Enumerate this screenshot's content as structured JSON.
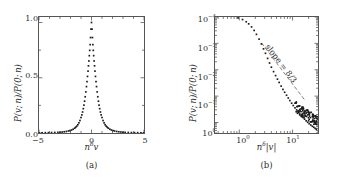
{
  "figure": {
    "panel_a_label": "(a)",
    "panel_b_label": "(b)"
  },
  "panel_a": {
    "ylabel": "P(v; n)/P(0; n)",
    "xlabel_base": "n",
    "xlabel_exp": "δ",
    "xlabel_tail": "v",
    "yticks": [
      "0.0",
      "0.5",
      "1.0"
    ],
    "xticks": [
      "−5",
      "0",
      "5"
    ]
  },
  "panel_b": {
    "ylabel": "P(v; n)/P(0; n)",
    "xlabel_base": "n",
    "xlabel_exp": "δ",
    "xlabel_tail": "|v|",
    "annotation": "slope = 8/3",
    "ytick_mantissa": "10",
    "yticks_exp": [
      "−4",
      "−3",
      "−2",
      "−1",
      "0"
    ],
    "xticks_exp": [
      "0",
      "1"
    ]
  },
  "chart_data": [
    {
      "type": "scatter",
      "panel": "(a)",
      "title": "",
      "xlabel": "n^δ v",
      "ylabel": "P(v; n)/P(0; n)",
      "xlim": [
        -5,
        5
      ],
      "ylim": [
        0,
        1.05
      ],
      "xticks": [
        -5,
        0,
        5
      ],
      "yticks": [
        0.0,
        0.5,
        1.0
      ],
      "grid": false,
      "legend": null,
      "scale": "linear",
      "x": [
        -5.0,
        -4.7,
        -4.4,
        -4.1,
        -3.8,
        -3.5,
        -3.2,
        -3.0,
        -2.8,
        -2.6,
        -2.4,
        -2.2,
        -2.05,
        -1.9,
        -1.75,
        -1.6,
        -1.5,
        -1.4,
        -1.3,
        -1.2,
        -1.1,
        -1.0,
        -0.92,
        -0.85,
        -0.78,
        -0.72,
        -0.66,
        -0.6,
        -0.54,
        -0.48,
        -0.43,
        -0.38,
        -0.33,
        -0.29,
        -0.25,
        -0.21,
        -0.17,
        -0.13,
        -0.09,
        -0.05,
        0.0,
        0.05,
        0.09,
        0.13,
        0.17,
        0.21,
        0.25,
        0.29,
        0.33,
        0.38,
        0.43,
        0.48,
        0.54,
        0.6,
        0.66,
        0.72,
        0.78,
        0.85,
        0.92,
        1.0,
        1.1,
        1.2,
        1.3,
        1.4,
        1.5,
        1.6,
        1.75,
        1.9,
        2.05,
        2.2,
        2.4,
        2.6,
        2.8,
        3.0,
        3.2,
        3.5,
        3.8,
        4.1,
        4.4,
        4.7,
        5.0
      ],
      "y": [
        0.002,
        0.002,
        0.003,
        0.003,
        0.004,
        0.005,
        0.006,
        0.007,
        0.009,
        0.011,
        0.014,
        0.018,
        0.022,
        0.027,
        0.034,
        0.044,
        0.052,
        0.062,
        0.075,
        0.092,
        0.113,
        0.14,
        0.164,
        0.19,
        0.22,
        0.252,
        0.288,
        0.328,
        0.372,
        0.42,
        0.465,
        0.512,
        0.56,
        0.608,
        0.652,
        0.7,
        0.748,
        0.8,
        0.864,
        0.94,
        1.0,
        0.94,
        0.864,
        0.8,
        0.748,
        0.7,
        0.652,
        0.608,
        0.56,
        0.512,
        0.465,
        0.42,
        0.372,
        0.328,
        0.288,
        0.252,
        0.22,
        0.19,
        0.164,
        0.14,
        0.113,
        0.092,
        0.075,
        0.062,
        0.052,
        0.044,
        0.034,
        0.027,
        0.022,
        0.018,
        0.014,
        0.011,
        0.009,
        0.007,
        0.006,
        0.005,
        0.004,
        0.003,
        0.003,
        0.002,
        0.002
      ]
    },
    {
      "type": "scatter",
      "panel": "(b)",
      "title": "",
      "xlabel": "n^δ |v|",
      "ylabel": "P(v; n)/P(0; n)",
      "xscale": "log",
      "yscale": "log-inverted",
      "xlim": [
        0.35,
        30
      ],
      "ylim": [
        1.0,
        4e-05
      ],
      "xticks": [
        1,
        10
      ],
      "yticks": [
        1,
        0.1,
        0.01,
        0.001,
        0.0001
      ],
      "grid": false,
      "legend": null,
      "annotation": "slope = 8/3",
      "annotation_slope": 2.6667,
      "x": [
        0.95,
        1.15,
        1.35,
        1.5,
        1.7,
        1.9,
        2.1,
        2.35,
        2.6,
        2.85,
        3.1,
        3.4,
        3.7,
        4.0,
        4.4,
        4.8,
        5.2,
        5.6,
        6.1,
        6.6,
        7.1,
        7.7,
        8.3,
        8.9,
        9.6,
        10.3,
        11.1,
        11.9,
        12.8,
        13.7,
        14.7,
        15.7,
        16.8,
        18.0,
        19.2,
        20.5,
        22.0,
        23.5,
        25.0,
        26.5,
        28.0
      ],
      "y": [
        0.92,
        0.8,
        0.66,
        0.55,
        0.42,
        0.31,
        0.22,
        0.145,
        0.095,
        0.062,
        0.042,
        0.027,
        0.018,
        0.0125,
        0.0085,
        0.006,
        0.0044,
        0.0033,
        0.0024,
        0.0018,
        0.0014,
        0.00108,
        0.00085,
        0.00068,
        0.00054,
        0.00044,
        0.00036,
        0.0003,
        0.00025,
        0.00021,
        0.00018,
        0.000155,
        0.000134,
        0.000116,
        0.000102,
        9e-05,
        8e-05,
        7.2e-05,
        6.6e-05,
        6e-05,
        5.5e-05
      ]
    }
  ]
}
